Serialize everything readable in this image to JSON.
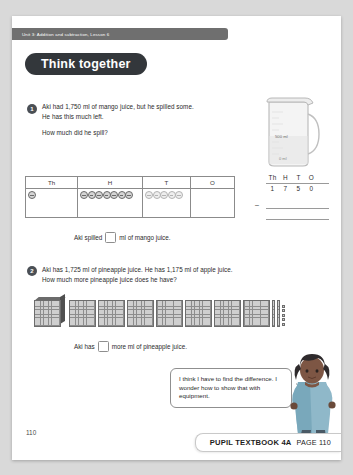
{
  "runhead": {
    "text": "Unit 3: Addition and subtraction, Lesson 6"
  },
  "section": {
    "title": "Think together"
  },
  "questions": [
    {
      "number": "1",
      "line1": "Aki had 1,750 ml of mango juice, but he spilled some.",
      "line2": "He has this much left.",
      "line3": "How much did he spill?",
      "answer_prefix": "Aki spilled",
      "answer_suffix": "ml of mango juice.",
      "answer_value": ""
    },
    {
      "number": "2",
      "line1": "Aki has 1,725 ml of pineapple juice. He has 1,175 ml of apple juice.",
      "line2": "How much more pineapple juice does he have?",
      "answer_prefix": "Aki has",
      "answer_suffix": "more ml of pineapple juice.",
      "answer_value": ""
    }
  ],
  "jug": {
    "label_upper": "500 ml",
    "label_lower": "0 ml"
  },
  "place_value_table": {
    "headers": [
      "Th",
      "H",
      "T",
      "O"
    ],
    "counts": {
      "Th": 1,
      "H": 7,
      "T": 5,
      "O": 0
    }
  },
  "column_method": {
    "headers": [
      "Th",
      "H",
      "T",
      "O"
    ],
    "minuend": [
      "1",
      "7",
      "5",
      "0"
    ],
    "operator": "–"
  },
  "base_ten_blocks": {
    "thousands": 1,
    "hundreds": 7,
    "tens": 2,
    "ones": 5
  },
  "speech_bubble": {
    "text": "I think I have to find the difference. I wonder how to show that with equipment."
  },
  "footer": {
    "folio": "110",
    "book": "PUPIL TEXTBOOK 4A",
    "page": "PAGE 110"
  }
}
